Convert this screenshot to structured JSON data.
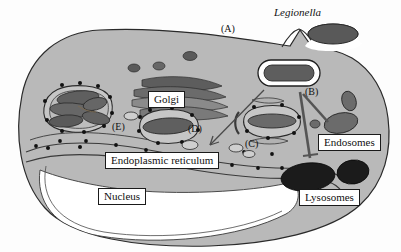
{
  "figure": {
    "organism_title": "Legionella",
    "background_color": "#fdfdfd",
    "cytoplasm_color": "#b9b9b9",
    "nucleus_color": "#ffffff",
    "membrane_color": "#222222"
  },
  "labels": {
    "golgi": "Golgi",
    "endoplasmic_reticulum": "Endoplasmic reticulum",
    "nucleus": "Nucleus",
    "endosomes": "Endosomes",
    "lysosomes": "Lysosomes"
  },
  "callouts": {
    "a": "(A)",
    "b": "(B)",
    "c": "(C)",
    "d": "(D)",
    "e": "(E)"
  },
  "structures": [
    {
      "name": "legionella-bacterium-extracellular",
      "type": "bacterium",
      "fill": "#5e5e5e"
    },
    {
      "name": "legionella-vacuole",
      "type": "vacuole",
      "fill": "#ffffff"
    },
    {
      "name": "phagosome-cluster",
      "type": "phagosome",
      "fill": "#c9c9c9"
    },
    {
      "name": "golgi-stack",
      "type": "golgi",
      "fill": "#6e6e6e"
    },
    {
      "name": "endosome",
      "type": "endosome",
      "fill": "#6b6b6b"
    },
    {
      "name": "lysosome",
      "type": "lysosome",
      "fill": "#1b1b1b"
    },
    {
      "name": "ribosome",
      "type": "ribosome",
      "fill": "#111111"
    }
  ]
}
